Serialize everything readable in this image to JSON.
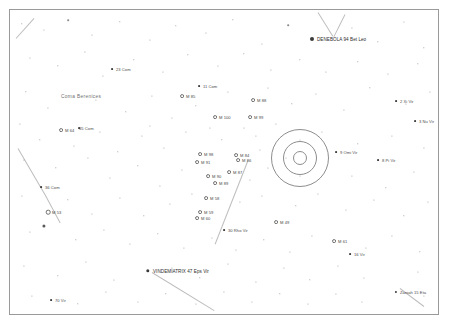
{
  "chart": {
    "kind": "star-chart",
    "title_visible": false,
    "width": 450,
    "height": 326,
    "background": "#ffffff",
    "frame": {
      "x": 9,
      "y": 9,
      "width": 430,
      "height": 306,
      "border_color": "#9a9a9a"
    },
    "constellation_region": "Coma Berenices / Virgo",
    "label_color": "#4a4a4a",
    "star_color": "#3a3a3a",
    "ring_color": "#8d8d8d",
    "line_color": "#bdbdbd"
  },
  "rings": [
    {
      "name": "field-circle-outer",
      "cx": 300,
      "cy": 158,
      "r": 28
    },
    {
      "name": "field-circle-middle",
      "cx": 300,
      "cy": 158,
      "r": 16
    },
    {
      "name": "field-circle-inner",
      "cx": 300,
      "cy": 158,
      "r": 6
    }
  ],
  "constellation_lines": [
    {
      "name": "line-upper-right",
      "x1": 318,
      "y1": 12,
      "x2": 333,
      "y2": 36
    },
    {
      "name": "line-upper-right-2",
      "x1": 345,
      "y1": 14,
      "x2": 334,
      "y2": 36
    },
    {
      "name": "line-left-upper",
      "x1": 18,
      "y1": 148,
      "x2": 46,
      "y2": 196
    },
    {
      "name": "line-left-lower",
      "x1": 46,
      "y1": 196,
      "x2": 60,
      "y2": 222
    },
    {
      "name": "line-center-down",
      "x1": 248,
      "y1": 160,
      "x2": 215,
      "y2": 244
    },
    {
      "name": "line-vindemiatrix",
      "x1": 152,
      "y1": 272,
      "x2": 214,
      "y2": 310
    },
    {
      "name": "line-zaniah",
      "x1": 400,
      "y1": 288,
      "x2": 424,
      "y2": 306
    },
    {
      "name": "line-topleft-corner",
      "x1": 16,
      "y1": 38,
      "x2": 34,
      "y2": 18
    }
  ],
  "labeled_objects": [
    {
      "name": "denebola",
      "label": "DENEBOLA 94 Bet Leo",
      "x": 312,
      "y": 39,
      "mag_size": 4.0,
      "type": "filled",
      "label_dx": 5,
      "prominent": true
    },
    {
      "name": "com-23",
      "label": "23 Com",
      "x": 112,
      "y": 69,
      "mag_size": 1.8,
      "type": "filled",
      "label_dx": 4
    },
    {
      "name": "coma-berenices",
      "label": "Coma Berenices",
      "x": 61,
      "y": 96,
      "type": "constellation",
      "label_dx": 0
    },
    {
      "name": "com-11",
      "label": "11 Com",
      "x": 199,
      "y": 86,
      "mag_size": 1.8,
      "type": "filled",
      "label_dx": 4
    },
    {
      "name": "m85",
      "label": "M 85",
      "x": 182,
      "y": 96,
      "mag_size": 1.8,
      "type": "open",
      "label_dx": 4
    },
    {
      "name": "m88",
      "label": "M 88",
      "x": 253,
      "y": 100,
      "mag_size": 1.8,
      "type": "open",
      "label_dx": 4
    },
    {
      "name": "m100",
      "label": "M 100",
      "x": 215,
      "y": 117,
      "mag_size": 1.8,
      "type": "open",
      "label_dx": 4
    },
    {
      "name": "m99",
      "label": "M 99",
      "x": 250,
      "y": 117,
      "mag_size": 1.8,
      "type": "open",
      "label_dx": 4
    },
    {
      "name": "xi-vir-2",
      "label": "2 Xi Vir",
      "x": 396,
      "y": 101,
      "mag_size": 1.8,
      "type": "filled",
      "label_dx": 4
    },
    {
      "name": "nu-vir-3",
      "label": "3 Nu Vir",
      "x": 415,
      "y": 121,
      "mag_size": 1.8,
      "type": "filled",
      "label_dx": 4
    },
    {
      "name": "m64",
      "label": "M 64",
      "x": 61,
      "y": 130,
      "mag_size": 1.8,
      "type": "open",
      "label_dx": 4
    },
    {
      "name": "com-35",
      "label": "35 Com",
      "x": 79,
      "y": 128,
      "mag_size": 1.8,
      "type": "filled",
      "label_dx": 0
    },
    {
      "name": "m98",
      "label": "M 98",
      "x": 200,
      "y": 154,
      "mag_size": 1.8,
      "type": "open",
      "label_dx": 4
    },
    {
      "name": "m91",
      "label": "M 91",
      "x": 197,
      "y": 162,
      "mag_size": 1.8,
      "type": "open",
      "label_dx": 4
    },
    {
      "name": "m90",
      "label": "M 90",
      "x": 208,
      "y": 176,
      "mag_size": 1.8,
      "type": "open",
      "label_dx": 4
    },
    {
      "name": "m84-m86-group",
      "label": "M 84",
      "x": 236,
      "y": 155,
      "mag_size": 1.8,
      "type": "open",
      "label_dx": 4
    },
    {
      "name": "m86",
      "label": "M 86",
      "x": 238,
      "y": 160,
      "mag_size": 1.8,
      "type": "open",
      "label_dx": 4
    },
    {
      "name": "omi-vir-9",
      "label": "9 Omi Vir",
      "x": 336,
      "y": 152,
      "mag_size": 1.8,
      "type": "filled",
      "label_dx": 4
    },
    {
      "name": "pi-vir-8",
      "label": "8 Pi Vir",
      "x": 378,
      "y": 160,
      "mag_size": 1.8,
      "type": "filled",
      "label_dx": 4
    },
    {
      "name": "m87",
      "label": "M 87",
      "x": 229,
      "y": 172,
      "mag_size": 1.8,
      "type": "open",
      "label_dx": 4
    },
    {
      "name": "com-36",
      "label": "36 Com",
      "x": 41,
      "y": 187,
      "mag_size": 1.8,
      "type": "filled",
      "label_dx": 4
    },
    {
      "name": "m89",
      "label": "M 89",
      "x": 215,
      "y": 183,
      "mag_size": 1.8,
      "type": "open",
      "label_dx": 4
    },
    {
      "name": "m58",
      "label": "M 58",
      "x": 206,
      "y": 198,
      "mag_size": 1.8,
      "type": "open",
      "label_dx": 4
    },
    {
      "name": "m53",
      "label": "M 53",
      "x": 48,
      "y": 212,
      "mag_size": 2.6,
      "type": "open",
      "label_dx": 4
    },
    {
      "name": "m59",
      "label": "M 59",
      "x": 200,
      "y": 212,
      "mag_size": 1.8,
      "type": "open",
      "label_dx": 4
    },
    {
      "name": "m60",
      "label": "M 60",
      "x": 197,
      "y": 218,
      "mag_size": 1.8,
      "type": "open",
      "label_dx": 4
    },
    {
      "name": "m49",
      "label": "M 49",
      "x": 276,
      "y": 222,
      "mag_size": 1.8,
      "type": "open",
      "label_dx": 4
    },
    {
      "name": "rho-vir-30",
      "label": "30 Rho Vir",
      "x": 224,
      "y": 230,
      "mag_size": 1.8,
      "type": "filled",
      "label_dx": 4
    },
    {
      "name": "m61",
      "label": "M 61",
      "x": 334,
      "y": 241,
      "mag_size": 1.8,
      "type": "open",
      "label_dx": 4
    },
    {
      "name": "vir-16",
      "label": "16 Vir",
      "x": 350,
      "y": 254,
      "mag_size": 1.8,
      "type": "filled",
      "label_dx": 4
    },
    {
      "name": "vindemiatrix",
      "label": "VINDEMIATRIX 47 Eps Vir",
      "x": 148,
      "y": 271,
      "mag_size": 3.4,
      "type": "filled",
      "label_dx": 5,
      "prominent": true
    },
    {
      "name": "zaniah",
      "label": "Zaniah 15 Eta",
      "x": 396,
      "y": 292,
      "mag_size": 2.2,
      "type": "filled",
      "label_dx": 4
    },
    {
      "name": "vir-70",
      "label": "70 Vir",
      "x": 51,
      "y": 300,
      "mag_size": 1.8,
      "type": "filled",
      "label_dx": 4
    }
  ],
  "field_stars": [
    {
      "x": 22,
      "y": 24,
      "r": 0.7
    },
    {
      "x": 44,
      "y": 30,
      "r": 0.6
    },
    {
      "x": 68,
      "y": 20,
      "r": 0.8
    },
    {
      "x": 92,
      "y": 35,
      "r": 0.6
    },
    {
      "x": 120,
      "y": 22,
      "r": 0.7
    },
    {
      "x": 150,
      "y": 40,
      "r": 0.6
    },
    {
      "x": 176,
      "y": 26,
      "r": 0.7
    },
    {
      "x": 206,
      "y": 33,
      "r": 0.6
    },
    {
      "x": 233,
      "y": 20,
      "r": 0.7
    },
    {
      "x": 262,
      "y": 44,
      "r": 0.6
    },
    {
      "x": 288,
      "y": 25,
      "r": 0.8
    },
    {
      "x": 352,
      "y": 28,
      "r": 0.6
    },
    {
      "x": 378,
      "y": 42,
      "r": 0.7
    },
    {
      "x": 404,
      "y": 22,
      "r": 0.6
    },
    {
      "x": 424,
      "y": 48,
      "r": 0.7
    },
    {
      "x": 30,
      "y": 58,
      "r": 0.6
    },
    {
      "x": 58,
      "y": 66,
      "r": 0.7
    },
    {
      "x": 85,
      "y": 52,
      "r": 0.6
    },
    {
      "x": 103,
      "y": 76,
      "r": 0.6
    },
    {
      "x": 134,
      "y": 60,
      "r": 0.7
    },
    {
      "x": 163,
      "y": 72,
      "r": 0.6
    },
    {
      "x": 188,
      "y": 55,
      "r": 0.7
    },
    {
      "x": 218,
      "y": 66,
      "r": 0.6
    },
    {
      "x": 244,
      "y": 54,
      "r": 0.7
    },
    {
      "x": 271,
      "y": 70,
      "r": 0.6
    },
    {
      "x": 300,
      "y": 60,
      "r": 0.7
    },
    {
      "x": 326,
      "y": 72,
      "r": 0.6
    },
    {
      "x": 358,
      "y": 62,
      "r": 0.7
    },
    {
      "x": 388,
      "y": 74,
      "r": 0.6
    },
    {
      "x": 418,
      "y": 64,
      "r": 0.7
    },
    {
      "x": 26,
      "y": 92,
      "r": 0.7
    },
    {
      "x": 48,
      "y": 108,
      "r": 0.6
    },
    {
      "x": 96,
      "y": 100,
      "r": 0.6
    },
    {
      "x": 126,
      "y": 112,
      "r": 0.7
    },
    {
      "x": 152,
      "y": 96,
      "r": 0.6
    },
    {
      "x": 172,
      "y": 118,
      "r": 0.6
    },
    {
      "x": 196,
      "y": 106,
      "r": 0.7
    },
    {
      "x": 228,
      "y": 92,
      "r": 0.6
    },
    {
      "x": 268,
      "y": 88,
      "r": 0.6
    },
    {
      "x": 292,
      "y": 104,
      "r": 0.7
    },
    {
      "x": 316,
      "y": 94,
      "r": 0.6
    },
    {
      "x": 344,
      "y": 110,
      "r": 0.6
    },
    {
      "x": 370,
      "y": 88,
      "r": 0.7
    },
    {
      "x": 406,
      "y": 104,
      "r": 0.6
    },
    {
      "x": 430,
      "y": 92,
      "r": 0.6
    },
    {
      "x": 20,
      "y": 124,
      "r": 0.6
    },
    {
      "x": 40,
      "y": 140,
      "r": 0.7
    },
    {
      "x": 74,
      "y": 146,
      "r": 0.6
    },
    {
      "x": 100,
      "y": 132,
      "r": 0.6
    },
    {
      "x": 118,
      "y": 152,
      "r": 0.7
    },
    {
      "x": 142,
      "y": 136,
      "r": 0.6
    },
    {
      "x": 164,
      "y": 148,
      "r": 0.6
    },
    {
      "x": 186,
      "y": 132,
      "r": 0.6
    },
    {
      "x": 222,
      "y": 140,
      "r": 0.7
    },
    {
      "x": 256,
      "y": 136,
      "r": 0.6
    },
    {
      "x": 276,
      "y": 124,
      "r": 0.6
    },
    {
      "x": 322,
      "y": 132,
      "r": 0.6
    },
    {
      "x": 358,
      "y": 144,
      "r": 0.7
    },
    {
      "x": 392,
      "y": 136,
      "r": 0.6
    },
    {
      "x": 424,
      "y": 148,
      "r": 0.6
    },
    {
      "x": 24,
      "y": 160,
      "r": 0.6
    },
    {
      "x": 56,
      "y": 168,
      "r": 0.7
    },
    {
      "x": 88,
      "y": 158,
      "r": 0.6
    },
    {
      "x": 110,
      "y": 178,
      "r": 0.6
    },
    {
      "x": 138,
      "y": 166,
      "r": 0.7
    },
    {
      "x": 160,
      "y": 186,
      "r": 0.6
    },
    {
      "x": 182,
      "y": 170,
      "r": 0.6
    },
    {
      "x": 250,
      "y": 180,
      "r": 0.6
    },
    {
      "x": 268,
      "y": 168,
      "r": 0.6
    },
    {
      "x": 352,
      "y": 176,
      "r": 0.6
    },
    {
      "x": 386,
      "y": 188,
      "r": 0.7
    },
    {
      "x": 414,
      "y": 172,
      "r": 0.6
    },
    {
      "x": 22,
      "y": 196,
      "r": 0.6
    },
    {
      "x": 68,
      "y": 200,
      "r": 0.7
    },
    {
      "x": 92,
      "y": 214,
      "r": 0.6
    },
    {
      "x": 120,
      "y": 198,
      "r": 0.6
    },
    {
      "x": 144,
      "y": 216,
      "r": 0.7
    },
    {
      "x": 170,
      "y": 204,
      "r": 0.6
    },
    {
      "x": 192,
      "y": 194,
      "r": 0.6
    },
    {
      "x": 240,
      "y": 202,
      "r": 0.6
    },
    {
      "x": 262,
      "y": 196,
      "r": 0.6
    },
    {
      "x": 296,
      "y": 206,
      "r": 0.7
    },
    {
      "x": 318,
      "y": 194,
      "r": 0.6
    },
    {
      "x": 346,
      "y": 210,
      "r": 0.6
    },
    {
      "x": 374,
      "y": 200,
      "r": 0.6
    },
    {
      "x": 404,
      "y": 216,
      "r": 0.7
    },
    {
      "x": 428,
      "y": 202,
      "r": 0.6
    },
    {
      "x": 30,
      "y": 232,
      "r": 0.6
    },
    {
      "x": 44,
      "y": 226,
      "r": 1.6
    },
    {
      "x": 76,
      "y": 240,
      "r": 0.7
    },
    {
      "x": 104,
      "y": 230,
      "r": 0.6
    },
    {
      "x": 130,
      "y": 244,
      "r": 0.6
    },
    {
      "x": 158,
      "y": 234,
      "r": 0.7
    },
    {
      "x": 184,
      "y": 248,
      "r": 0.6
    },
    {
      "x": 212,
      "y": 238,
      "r": 0.6
    },
    {
      "x": 236,
      "y": 250,
      "r": 0.6
    },
    {
      "x": 264,
      "y": 240,
      "r": 0.7
    },
    {
      "x": 290,
      "y": 252,
      "r": 0.6
    },
    {
      "x": 312,
      "y": 236,
      "r": 0.6
    },
    {
      "x": 366,
      "y": 248,
      "r": 0.6
    },
    {
      "x": 392,
      "y": 236,
      "r": 0.6
    },
    {
      "x": 420,
      "y": 252,
      "r": 0.7
    },
    {
      "x": 24,
      "y": 266,
      "r": 0.6
    },
    {
      "x": 58,
      "y": 276,
      "r": 0.7
    },
    {
      "x": 86,
      "y": 262,
      "r": 0.6
    },
    {
      "x": 114,
      "y": 280,
      "r": 0.6
    },
    {
      "x": 172,
      "y": 268,
      "r": 0.6
    },
    {
      "x": 200,
      "y": 278,
      "r": 0.7
    },
    {
      "x": 228,
      "y": 264,
      "r": 0.6
    },
    {
      "x": 256,
      "y": 282,
      "r": 0.6
    },
    {
      "x": 284,
      "y": 268,
      "r": 0.6
    },
    {
      "x": 310,
      "y": 280,
      "r": 0.7
    },
    {
      "x": 338,
      "y": 266,
      "r": 0.6
    },
    {
      "x": 364,
      "y": 278,
      "r": 0.6
    },
    {
      "x": 418,
      "y": 272,
      "r": 0.6
    },
    {
      "x": 32,
      "y": 296,
      "r": 0.6
    },
    {
      "x": 78,
      "y": 304,
      "r": 0.7
    },
    {
      "x": 106,
      "y": 292,
      "r": 0.6
    },
    {
      "x": 138,
      "y": 302,
      "r": 0.6
    },
    {
      "x": 166,
      "y": 294,
      "r": 0.7
    },
    {
      "x": 196,
      "y": 304,
      "r": 0.6
    },
    {
      "x": 224,
      "y": 292,
      "r": 0.6
    },
    {
      "x": 252,
      "y": 302,
      "r": 0.6
    },
    {
      "x": 280,
      "y": 294,
      "r": 0.7
    },
    {
      "x": 308,
      "y": 304,
      "r": 0.6
    },
    {
      "x": 336,
      "y": 294,
      "r": 0.6
    },
    {
      "x": 362,
      "y": 302,
      "r": 0.6
    },
    {
      "x": 424,
      "y": 296,
      "r": 0.6
    },
    {
      "x": 150,
      "y": 126,
      "r": 0.6
    },
    {
      "x": 210,
      "y": 128,
      "r": 0.6
    },
    {
      "x": 244,
      "y": 128,
      "r": 0.6
    },
    {
      "x": 260,
      "y": 150,
      "r": 0.6
    },
    {
      "x": 300,
      "y": 140,
      "r": 0.5
    },
    {
      "x": 300,
      "y": 176,
      "r": 0.5
    },
    {
      "x": 286,
      "y": 158,
      "r": 0.5
    }
  ]
}
